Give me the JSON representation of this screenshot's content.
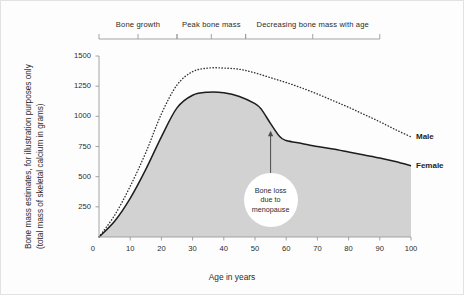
{
  "chart_data": {
    "type": "area",
    "title": "",
    "xlabel": "Age in years",
    "ylabel_line1": "Bone mass estimates, for illustration purposes only",
    "ylabel_line2": "(total mass of skeletal calcium in grams)",
    "xlim": [
      0,
      100
    ],
    "ylim": [
      0,
      1500
    ],
    "xticks": [
      0,
      10,
      20,
      30,
      40,
      50,
      60,
      70,
      80,
      90,
      100
    ],
    "xtick_labels": [
      "0",
      "10",
      "20",
      "30",
      "40",
      "50",
      "60",
      "70",
      "80",
      "90",
      "100"
    ],
    "yticks": [
      0,
      250,
      500,
      750,
      1000,
      1250,
      1500
    ],
    "ytick_labels": [
      "0",
      "250",
      "500",
      "750",
      "1000",
      "1250",
      "1500"
    ],
    "grid": false,
    "legend_position": "right-inline",
    "series": [
      {
        "name": "Male",
        "style": "dotted",
        "color": "#333333",
        "x": [
          0,
          5,
          10,
          15,
          20,
          25,
          30,
          35,
          40,
          45,
          50,
          55,
          60,
          65,
          70,
          75,
          80,
          85,
          90,
          95,
          100
        ],
        "values": [
          0,
          180,
          420,
          700,
          1020,
          1260,
          1370,
          1400,
          1400,
          1390,
          1360,
          1320,
          1280,
          1235,
          1185,
          1130,
          1075,
          1015,
          955,
          890,
          830
        ]
      },
      {
        "name": "Female",
        "style": "solid-filled",
        "color": "#1d1d1d",
        "fill": "#d2d2d2",
        "x": [
          0,
          5,
          10,
          15,
          20,
          25,
          30,
          35,
          40,
          45,
          50,
          52,
          55,
          58,
          60,
          65,
          70,
          75,
          80,
          85,
          90,
          95,
          100
        ],
        "values": [
          0,
          130,
          320,
          560,
          830,
          1070,
          1175,
          1200,
          1195,
          1165,
          1105,
          1060,
          940,
          830,
          800,
          775,
          750,
          730,
          705,
          680,
          655,
          625,
          590
        ]
      }
    ],
    "annotations": [
      {
        "name": "bone-loss-callout",
        "text_line1": "Bone loss",
        "text_line2": "due to",
        "text_line3": "menopause",
        "arrow_from_x": 55,
        "arrow_from_y": 430,
        "arrow_to_x": 55,
        "arrow_to_y": 880
      }
    ],
    "phase_brackets": [
      {
        "label": "Bone growth",
        "x_start": 0,
        "x_end": 25
      },
      {
        "label": "Peak bone mass",
        "x_start": 25,
        "x_end": 47
      },
      {
        "label": "Decreasing bone mass with age",
        "x_start": 47,
        "x_end": 90
      }
    ]
  },
  "colors": {
    "background": "#fdfdfd",
    "area_fill": "#d2d2d2",
    "female_line": "#1d1d1d",
    "male_line": "#333333",
    "axis": "#9a9a9a",
    "text": "#2b2b2b"
  }
}
